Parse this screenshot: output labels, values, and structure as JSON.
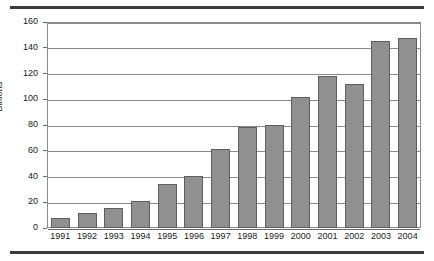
{
  "chart_data": {
    "type": "bar",
    "title": "",
    "subtitle": "",
    "xlabel": "",
    "ylabel": "Billions",
    "categories": [
      "1991",
      "1992",
      "1993",
      "1994",
      "1995",
      "1996",
      "1997",
      "1998",
      "1999",
      "2000",
      "2001",
      "2002",
      "2003",
      "2004"
    ],
    "values": [
      8,
      11.5,
      15.5,
      21,
      34.5,
      40.5,
      61,
      78.5,
      80,
      102,
      118,
      112,
      145.5,
      147.5
    ],
    "ylim": [
      0,
      160
    ],
    "ytick_values": [
      0,
      20,
      40,
      60,
      80,
      100,
      120,
      140,
      160
    ],
    "ytick_labels": [
      "0",
      "20",
      "40",
      "60",
      "80",
      "100",
      "120",
      "140",
      "160"
    ],
    "grid": true,
    "grid_axis": "y",
    "legend": false,
    "legend_position": "none",
    "bar_color": "#909090",
    "bar_edge_color": "#5e5e5e",
    "grid_color": "#8a8a8a",
    "frame_color": "#8a8a8a",
    "rule_color": "#3b3b3b",
    "background": "#ffffff"
  },
  "figure": {
    "rule_top_label": "top-rule",
    "rule_bottom_label": "bottom-rule"
  }
}
